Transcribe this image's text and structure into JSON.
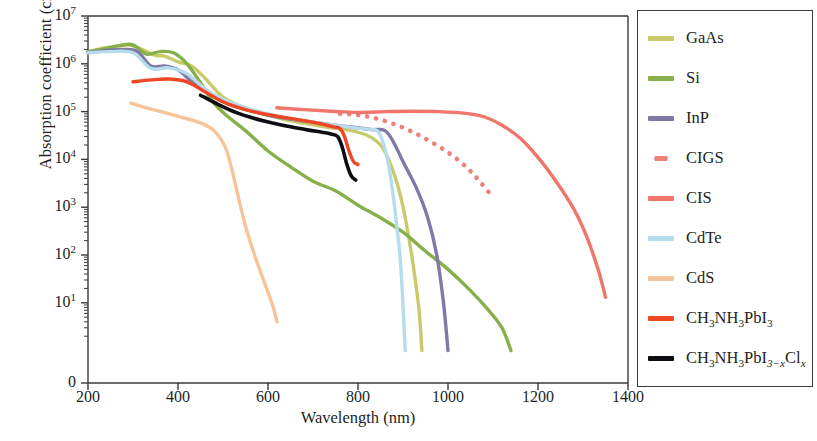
{
  "figure": {
    "x_axis_label": "Wavelength (nm)",
    "y_axis_label_main": "Absorption coefficient (cm",
    "y_axis_label_unit_sup": "−1",
    "y_axis_label_close": ")"
  },
  "axes": {
    "x_ticks": [
      "200",
      "400",
      "600",
      "800",
      "1000",
      "1200",
      "1400"
    ],
    "y_ticks": [
      {
        "base": "10",
        "exp": "7"
      },
      {
        "base": "10",
        "exp": "6"
      },
      {
        "base": "10",
        "exp": "5"
      },
      {
        "base": "10",
        "exp": "4"
      },
      {
        "base": "10",
        "exp": "3"
      },
      {
        "base": "10",
        "exp": "2"
      },
      {
        "base": "10",
        "exp": "1"
      },
      {
        "base": "0",
        "exp": ""
      }
    ]
  },
  "legend": {
    "items": [
      {
        "label": "GaAs",
        "color": "#c9ca6b",
        "style": "solid"
      },
      {
        "label": "Si",
        "color": "#86b04a",
        "style": "solid"
      },
      {
        "label": "InP",
        "color": "#8079a8",
        "style": "solid"
      },
      {
        "label": "CIGS",
        "color": "#ef7f79",
        "style": "dotted"
      },
      {
        "label": "CIS",
        "color": "#f0756a",
        "style": "solid"
      },
      {
        "label": "CdTe",
        "color": "#b6dced",
        "style": "solid"
      },
      {
        "label": "CdS",
        "color": "#f7c49a",
        "style": "solid"
      },
      {
        "label": "CH3NH3PbI3",
        "color": "#ef4723",
        "style": "solid",
        "rich": [
          {
            "t": "CH"
          },
          {
            "t": "3",
            "sub": true
          },
          {
            "t": "NH"
          },
          {
            "t": "3",
            "sub": true
          },
          {
            "t": "PbI"
          },
          {
            "t": "3",
            "sub": true
          }
        ]
      },
      {
        "label": "CH3NH3PbI3-xClx",
        "color": "#0d0d14",
        "style": "solid",
        "rich": [
          {
            "t": "CH"
          },
          {
            "t": "3",
            "sub": true
          },
          {
            "t": "NH"
          },
          {
            "t": "3",
            "sub": true
          },
          {
            "t": "PbI"
          },
          {
            "t": "3−x",
            "sub": true,
            "ital": true
          },
          {
            "t": "Cl"
          },
          {
            "t": "x",
            "sub": true,
            "ital": true
          }
        ]
      }
    ]
  },
  "chart_data": {
    "type": "line",
    "title": "",
    "xlabel": "Wavelength (nm)",
    "ylabel": "Absorption coefficient (cm^-1)",
    "xlim": [
      200,
      1400
    ],
    "ylim": [
      1,
      10000000
    ],
    "yscale": "log",
    "grid": false,
    "legend_position": "right-outside-box",
    "series": [
      {
        "name": "GaAs",
        "color": "#c9ca6b",
        "style": "solid",
        "points": [
          [
            200,
            1750000
          ],
          [
            230,
            2100000
          ],
          [
            260,
            2300000
          ],
          [
            290,
            2500000
          ],
          [
            320,
            2000000
          ],
          [
            350,
            1500000
          ],
          [
            370,
            1450000
          ],
          [
            400,
            1100000
          ],
          [
            430,
            900000
          ],
          [
            460,
            500000
          ],
          [
            500,
            200000
          ],
          [
            540,
            130000
          ],
          [
            580,
            95000
          ],
          [
            620,
            75000
          ],
          [
            660,
            62000
          ],
          [
            700,
            53000
          ],
          [
            740,
            46000
          ],
          [
            780,
            41000
          ],
          [
            820,
            32000
          ],
          [
            850,
            20000
          ],
          [
            870,
            9000
          ],
          [
            890,
            2500
          ],
          [
            905,
            600
          ],
          [
            920,
            90
          ],
          [
            935,
            8
          ],
          [
            942,
            1
          ]
        ]
      },
      {
        "name": "Si",
        "color": "#86b04a",
        "style": "solid",
        "points": [
          [
            200,
            1800000
          ],
          [
            230,
            2000000
          ],
          [
            270,
            2400000
          ],
          [
            300,
            2500000
          ],
          [
            330,
            1600000
          ],
          [
            360,
            1800000
          ],
          [
            390,
            1700000
          ],
          [
            420,
            1000000
          ],
          [
            450,
            400000
          ],
          [
            480,
            150000
          ],
          [
            510,
            80000
          ],
          [
            550,
            40000
          ],
          [
            600,
            15000
          ],
          [
            650,
            7000
          ],
          [
            700,
            3500
          ],
          [
            750,
            2200
          ],
          [
            800,
            1100
          ],
          [
            850,
            600
          ],
          [
            900,
            300
          ],
          [
            950,
            120
          ],
          [
            1000,
            50
          ],
          [
            1050,
            18
          ],
          [
            1090,
            7
          ],
          [
            1120,
            3
          ],
          [
            1140,
            1
          ]
        ]
      },
      {
        "name": "InP",
        "color": "#8079a8",
        "style": "solid",
        "points": [
          [
            200,
            1700000
          ],
          [
            240,
            1900000
          ],
          [
            280,
            2000000
          ],
          [
            310,
            1800000
          ],
          [
            340,
            900000
          ],
          [
            370,
            900000
          ],
          [
            400,
            750000
          ],
          [
            430,
            430000
          ],
          [
            470,
            230000
          ],
          [
            510,
            150000
          ],
          [
            550,
            110000
          ],
          [
            600,
            85000
          ],
          [
            650,
            70000
          ],
          [
            700,
            60000
          ],
          [
            750,
            52000
          ],
          [
            800,
            46000
          ],
          [
            830,
            42000
          ],
          [
            860,
            40000
          ],
          [
            880,
            22000
          ],
          [
            900,
            9000
          ],
          [
            930,
            2500
          ],
          [
            955,
            600
          ],
          [
            975,
            100
          ],
          [
            990,
            10
          ],
          [
            1000,
            1
          ]
        ]
      },
      {
        "name": "CIGS",
        "color": "#ef7f79",
        "style": "dotted",
        "points": [
          [
            760,
            90000
          ],
          [
            800,
            85000
          ],
          [
            840,
            72000
          ],
          [
            880,
            55000
          ],
          [
            920,
            38000
          ],
          [
            960,
            24000
          ],
          [
            1000,
            14000
          ],
          [
            1040,
            7000
          ],
          [
            1070,
            3500
          ],
          [
            1100,
            1600
          ]
        ]
      },
      {
        "name": "CIS",
        "color": "#f0756a",
        "style": "solid",
        "points": [
          [
            620,
            120000
          ],
          [
            680,
            110000
          ],
          [
            740,
            102000
          ],
          [
            800,
            96000
          ],
          [
            860,
            100000
          ],
          [
            920,
            102000
          ],
          [
            980,
            100000
          ],
          [
            1040,
            92000
          ],
          [
            1080,
            78000
          ],
          [
            1120,
            52000
          ],
          [
            1160,
            28000
          ],
          [
            1200,
            11000
          ],
          [
            1240,
            3500
          ],
          [
            1280,
            900
          ],
          [
            1310,
            220
          ],
          [
            1335,
            45
          ],
          [
            1350,
            13
          ]
        ]
      },
      {
        "name": "CdTe",
        "color": "#b6dced",
        "style": "solid",
        "points": [
          [
            200,
            1700000
          ],
          [
            250,
            1800000
          ],
          [
            300,
            1700000
          ],
          [
            340,
            800000
          ],
          [
            380,
            820000
          ],
          [
            420,
            620000
          ],
          [
            460,
            300000
          ],
          [
            500,
            180000
          ],
          [
            550,
            120000
          ],
          [
            600,
            90000
          ],
          [
            650,
            72000
          ],
          [
            700,
            60000
          ],
          [
            750,
            52000
          ],
          [
            790,
            46000
          ],
          [
            820,
            43000
          ],
          [
            845,
            38000
          ],
          [
            862,
            14000
          ],
          [
            875,
            3000
          ],
          [
            885,
            500
          ],
          [
            895,
            60
          ],
          [
            905,
            1
          ]
        ]
      },
      {
        "name": "CdS",
        "color": "#f7c49a",
        "style": "solid",
        "points": [
          [
            295,
            150000
          ],
          [
            330,
            120000
          ],
          [
            370,
            95000
          ],
          [
            410,
            75000
          ],
          [
            450,
            58000
          ],
          [
            480,
            40000
          ],
          [
            505,
            18000
          ],
          [
            520,
            6000
          ],
          [
            535,
            1500
          ],
          [
            550,
            400
          ],
          [
            570,
            100
          ],
          [
            590,
            30
          ],
          [
            610,
            9
          ],
          [
            620,
            4
          ]
        ]
      },
      {
        "name": "CH3NH3PbI3",
        "color": "#ef4723",
        "style": "solid",
        "points": [
          [
            300,
            420000
          ],
          [
            340,
            460000
          ],
          [
            380,
            480000
          ],
          [
            420,
            420000
          ],
          [
            460,
            260000
          ],
          [
            500,
            160000
          ],
          [
            550,
            110000
          ],
          [
            600,
            86000
          ],
          [
            650,
            72000
          ],
          [
            690,
            62000
          ],
          [
            720,
            55000
          ],
          [
            745,
            48000
          ],
          [
            760,
            44000
          ],
          [
            770,
            30000
          ],
          [
            780,
            15000
          ],
          [
            790,
            9000
          ],
          [
            800,
            7800
          ]
        ]
      },
      {
        "name": "CH3NH3PbI3-xClx",
        "color": "#0d0d14",
        "style": "solid",
        "points": [
          [
            450,
            220000
          ],
          [
            490,
            140000
          ],
          [
            530,
            95000
          ],
          [
            570,
            72000
          ],
          [
            610,
            58000
          ],
          [
            650,
            48000
          ],
          [
            690,
            41000
          ],
          [
            720,
            37000
          ],
          [
            740,
            34000
          ],
          [
            755,
            30000
          ],
          [
            765,
            18000
          ],
          [
            775,
            8000
          ],
          [
            785,
            4500
          ],
          [
            795,
            3700
          ]
        ]
      }
    ]
  }
}
